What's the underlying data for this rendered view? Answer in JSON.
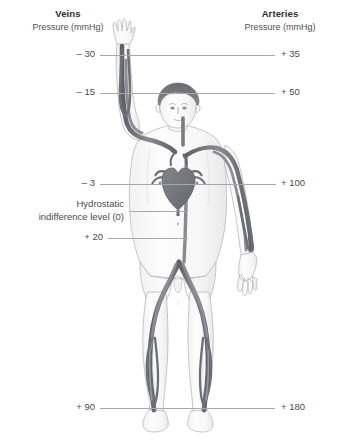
{
  "diagram": {
    "title_left": "Veins",
    "subtitle_left": "Pressure (mmHg)",
    "title_right": "Arteries",
    "subtitle_right": "Pressure (mmHg)",
    "hydrostatic_label_line1": "Hydrostatic",
    "hydrostatic_label_line2": "indifference level (0)",
    "levels": [
      {
        "vein": "– 30",
        "artery": "+ 35",
        "y": 55
      },
      {
        "vein": "– 15",
        "artery": "+ 50",
        "y": 93
      },
      {
        "vein": "– 3",
        "artery": "+ 100",
        "y": 184
      },
      {
        "vein": "",
        "artery": "",
        "y": 211
      },
      {
        "vein": "+ 20",
        "artery": "",
        "y": 238
      },
      {
        "vein": "+ 90",
        "artery": "+ 180",
        "y": 408
      }
    ],
    "colors": {
      "background": "#ffffff",
      "line": "#a8a8ac",
      "text": "#4a4a4a",
      "heading": "#2e2e2e",
      "vessel_dark": "#6f6f76",
      "vessel_mid": "#8e8e95",
      "body_outline": "#b9b9bd",
      "body_fill": "#fbfbfb",
      "hair": "#6d6d73",
      "heart": "#77777e"
    },
    "icons": {
      "figure": "human-body-anterior-figure",
      "heart": "heart-organ",
      "raised_arm": "raised-left-arm",
      "hanging_arm": "hanging-right-arm"
    }
  }
}
